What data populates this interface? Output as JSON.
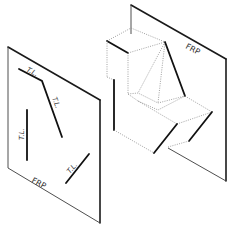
{
  "figure": {
    "left_plane": {
      "label": "FRP",
      "true_length_labels": [
        "T.L.",
        "T.L.",
        "T.L.",
        "T.L."
      ]
    },
    "right_plane": {
      "label": "FRP"
    },
    "colors": {
      "line": "#111111",
      "hidden_line": "#8a8a8a",
      "background": "#ffffff"
    }
  }
}
